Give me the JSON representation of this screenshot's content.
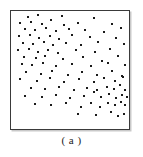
{
  "figure": {
    "caption": "( a )",
    "panel_label": "a",
    "frame_color": "#3a3a3a",
    "point_color": "#1a1a1a",
    "background_color": "#ffffff"
  },
  "chart_data": {
    "type": "scatter",
    "title": "",
    "subtitle": "",
    "xlabel": "",
    "ylabel": "",
    "annotations": [
      "( a )"
    ],
    "legend": [],
    "legend_position": "none",
    "grid": false,
    "axis_ticks": [],
    "xlim": [
      0,
      100
    ],
    "ylim": [
      0,
      100
    ],
    "marker": "square",
    "marker_size_px": 2,
    "n_points": 108,
    "series": [
      {
        "name": "points",
        "color": "#1a1a1a",
        "points": [
          [
            14,
            95
          ],
          [
            23,
            97
          ],
          [
            43,
            96
          ],
          [
            70,
            94
          ],
          [
            8,
            90
          ],
          [
            17,
            91
          ],
          [
            26,
            89
          ],
          [
            34,
            92
          ],
          [
            45,
            88
          ],
          [
            57,
            90
          ],
          [
            86,
            89
          ],
          [
            12,
            85
          ],
          [
            20,
            84
          ],
          [
            30,
            86
          ],
          [
            38,
            83
          ],
          [
            49,
            85
          ],
          [
            63,
            84
          ],
          [
            79,
            82
          ],
          [
            93,
            86
          ],
          [
            7,
            79
          ],
          [
            16,
            80
          ],
          [
            24,
            77
          ],
          [
            33,
            79
          ],
          [
            41,
            76
          ],
          [
            52,
            80
          ],
          [
            67,
            78
          ],
          [
            89,
            77
          ],
          [
            10,
            73
          ],
          [
            19,
            72
          ],
          [
            28,
            74
          ],
          [
            36,
            71
          ],
          [
            47,
            73
          ],
          [
            59,
            71
          ],
          [
            74,
            74
          ],
          [
            96,
            72
          ],
          [
            6,
            67
          ],
          [
            15,
            68
          ],
          [
            23,
            65
          ],
          [
            31,
            67
          ],
          [
            40,
            64
          ],
          [
            55,
            67
          ],
          [
            71,
            65
          ],
          [
            84,
            68
          ],
          [
            11,
            61
          ],
          [
            21,
            60
          ],
          [
            29,
            62
          ],
          [
            44,
            59
          ],
          [
            61,
            61
          ],
          [
            77,
            58
          ],
          [
            91,
            62
          ],
          [
            9,
            55
          ],
          [
            18,
            54
          ],
          [
            27,
            56
          ],
          [
            38,
            53
          ],
          [
            52,
            55
          ],
          [
            68,
            53
          ],
          [
            82,
            56
          ],
          [
            97,
            54
          ],
          [
            13,
            48
          ],
          [
            25,
            47
          ],
          [
            35,
            49
          ],
          [
            48,
            46
          ],
          [
            60,
            48
          ],
          [
            73,
            46
          ],
          [
            86,
            49
          ],
          [
            94,
            45
          ],
          [
            8,
            42
          ],
          [
            22,
            41
          ],
          [
            33,
            43
          ],
          [
            45,
            40
          ],
          [
            58,
            42
          ],
          [
            70,
            40
          ],
          [
            79,
            43
          ],
          [
            88,
            41
          ],
          [
            95,
            44
          ],
          [
            17,
            35
          ],
          [
            29,
            34
          ],
          [
            41,
            36
          ],
          [
            53,
            33
          ],
          [
            64,
            35
          ],
          [
            73,
            33
          ],
          [
            81,
            36
          ],
          [
            87,
            34
          ],
          [
            92,
            37
          ],
          [
            97,
            33
          ],
          [
            12,
            28
          ],
          [
            26,
            27
          ],
          [
            38,
            29
          ],
          [
            50,
            26
          ],
          [
            62,
            28
          ],
          [
            70,
            31
          ],
          [
            76,
            27
          ],
          [
            83,
            30
          ],
          [
            89,
            26
          ],
          [
            94,
            29
          ],
          [
            98,
            27
          ],
          [
            20,
            21
          ],
          [
            34,
            20
          ],
          [
            47,
            22
          ],
          [
            59,
            19
          ],
          [
            68,
            22
          ],
          [
            75,
            19
          ],
          [
            82,
            22
          ],
          [
            88,
            20
          ],
          [
            93,
            23
          ],
          [
            97,
            20
          ],
          [
            57,
            13
          ],
          [
            72,
            12
          ],
          [
            85,
            14
          ],
          [
            91,
            11
          ],
          [
            96,
            13
          ]
        ]
      }
    ]
  }
}
